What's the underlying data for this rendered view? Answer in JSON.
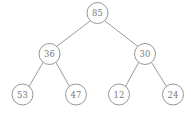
{
  "figure": {
    "kind": "binary-tree-diagram",
    "width": 191,
    "height": 114,
    "background_color": "#ffffff",
    "stroke_color": "#8a8a8a",
    "text_color": "#787878",
    "node_radius": 10.5
  },
  "tree": {
    "nodes": [
      {
        "id": "root",
        "label": "85",
        "cx": 97.5,
        "cy": 13.0
      },
      {
        "id": "n36",
        "label": "36",
        "cx": 49.5,
        "cy": 54.0
      },
      {
        "id": "n30",
        "label": "30",
        "cx": 145.0,
        "cy": 54.0
      },
      {
        "id": "n53",
        "label": "53",
        "cx": 22.5,
        "cy": 94.5
      },
      {
        "id": "n47",
        "label": "47",
        "cx": 76.0,
        "cy": 94.5
      },
      {
        "id": "n12",
        "label": "12",
        "cx": 119.0,
        "cy": 94.5
      },
      {
        "id": "n24",
        "label": "24",
        "cx": 173.0,
        "cy": 94.5
      }
    ],
    "edges": [
      {
        "id": "edge-85-36",
        "from": "root",
        "to": "n36",
        "x1": 90.0,
        "y1": 21.0,
        "x2": 56.5,
        "y2": 46.5
      },
      {
        "id": "edge-85-30",
        "from": "root",
        "to": "n30",
        "x1": 105.0,
        "y1": 21.0,
        "x2": 138.0,
        "y2": 46.5
      },
      {
        "id": "edge-36-53",
        "from": "n36",
        "to": "n53",
        "x1": 43.0,
        "y1": 62.5,
        "x2": 29.0,
        "y2": 86.5
      },
      {
        "id": "edge-36-47",
        "from": "n36",
        "to": "n47",
        "x1": 56.0,
        "y1": 62.5,
        "x2": 69.5,
        "y2": 86.5
      },
      {
        "id": "edge-30-12",
        "from": "n30",
        "to": "n12",
        "x1": 138.5,
        "y1": 62.5,
        "x2": 125.5,
        "y2": 86.5
      },
      {
        "id": "edge-30-24",
        "from": "n30",
        "to": "n24",
        "x1": 151.5,
        "y1": 62.5,
        "x2": 166.5,
        "y2": 86.5
      }
    ]
  }
}
